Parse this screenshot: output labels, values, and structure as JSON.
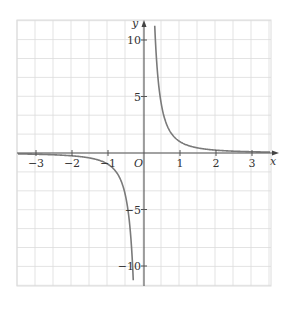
{
  "chart_data": {
    "type": "line",
    "title": "",
    "function": "y = 1/x^2 for x>0 and y = -1/x^2 style hyperbola-like curve (y = 1/x^2 sign(x))",
    "xlabel": "x",
    "ylabel": "y",
    "origin_label": "O",
    "xlim": [
      -3.5,
      3.5
    ],
    "ylim": [
      -11.8,
      11.8
    ],
    "x_ticks": [
      -3,
      -2,
      -1,
      1,
      2,
      3
    ],
    "x_tick_labels": [
      "−3",
      "−2",
      "−1",
      "1",
      "2",
      "3"
    ],
    "y_ticks": [
      -10,
      -5,
      5,
      10
    ],
    "y_tick_labels": [
      "−10",
      "−5",
      "5",
      "10"
    ],
    "grid": true,
    "grid_step_x": 0.5,
    "grid_step_y": 2.5,
    "series": [
      {
        "name": "curve",
        "color": "#7a7a7a",
        "points_right": [
          [
            0.3,
            11.1
          ],
          [
            0.5,
            4.0
          ],
          [
            0.75,
            1.78
          ],
          [
            1,
            1
          ],
          [
            1.5,
            0.44
          ],
          [
            2,
            0.25
          ],
          [
            3,
            0.11
          ],
          [
            3.5,
            0.08
          ]
        ],
        "points_left": [
          [
            -3.5,
            -0.08
          ],
          [
            -3,
            -0.11
          ],
          [
            -2,
            -0.25
          ],
          [
            -1.5,
            -0.44
          ],
          [
            -1,
            -1
          ],
          [
            -0.75,
            -1.78
          ],
          [
            -0.5,
            -4.0
          ],
          [
            -0.3,
            -11.1
          ]
        ]
      }
    ],
    "colors": {
      "grid": "#dcdcdc",
      "axes": "#555555",
      "curve": "#7a7a7a"
    }
  }
}
